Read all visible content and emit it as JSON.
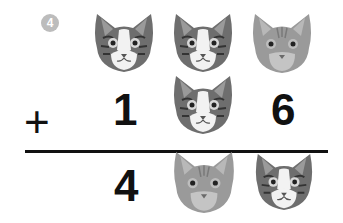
{
  "puzzle": {
    "number": "4",
    "operator": "+",
    "rows": [
      [
        "cat-tabby-white",
        "cat-tabby-white",
        "cat-orange"
      ],
      [
        "1",
        "cat-tabby-white",
        "6"
      ],
      [
        "4",
        "cat-orange",
        "cat-tabby-white"
      ]
    ],
    "row2": {
      "d1": "1",
      "d3": "6"
    },
    "result": {
      "d1": "4"
    }
  },
  "colors": {
    "badge": "#bcbcbc",
    "ink": "#111111"
  }
}
